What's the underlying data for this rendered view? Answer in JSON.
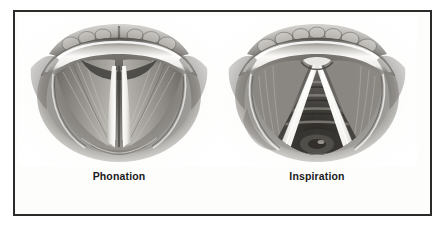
{
  "figure": {
    "type": "anatomical-illustration",
    "style": "grayscale pencil/airbrush medical drawing",
    "background_color": "#ffffff",
    "frame": {
      "border_color": "#2b2b2b",
      "border_width_px": 2,
      "fill_color": "#fdfdfc"
    },
    "panels": [
      {
        "id": "phonation",
        "label": "Phonation",
        "subject": "laryngoscopic view of the larynx with vocal folds adducted (closed)",
        "icon_name": "larynx-phonation-illustration",
        "features": {
          "glottis_state": "closed",
          "glottis_shape": "narrow vertical slit",
          "vocal_folds_color": "#f6f5f2",
          "tissue_color": "#8d8a86",
          "shadow_color": "#3a3835",
          "trachea_visible": false
        }
      },
      {
        "id": "inspiration",
        "label": "Inspiration",
        "subject": "laryngoscopic view of the larynx with vocal folds abducted (open)",
        "icon_name": "larynx-inspiration-illustration",
        "features": {
          "glottis_state": "open",
          "glottis_shape": "triangular aperture",
          "vocal_folds_color": "#f6f5f2",
          "tissue_color": "#8d8a86",
          "shadow_color": "#3a3835",
          "trachea_visible": true,
          "tracheal_rings_visible": true
        }
      }
    ],
    "label_color": "#1a1a1a"
  }
}
